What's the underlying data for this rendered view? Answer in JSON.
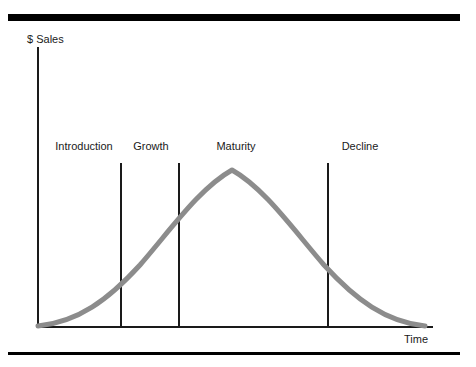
{
  "figure": {
    "background_color": "#ffffff",
    "width": 476,
    "height": 367
  },
  "rules": {
    "top_label": "top-rule",
    "bottom_label": "bottom-rule",
    "color": "#000000"
  },
  "axes": {
    "y_title": "$ Sales",
    "x_title": "Time",
    "color": "#1a1a1a"
  },
  "stages": [
    {
      "label": "Introduction",
      "center_x": 84,
      "divider_x": 120
    },
    {
      "label": "Growth",
      "center_x": 151,
      "divider_x": 178
    },
    {
      "label": "Maturity",
      "center_x": 236,
      "divider_x": 327
    },
    {
      "label": "Decline",
      "center_x": 360,
      "divider_x": null
    }
  ],
  "curve": {
    "color": "#8c8c8c",
    "stroke_width": 5,
    "path": "M 38 326 C 78 322, 108 300, 140 265 C 172 228, 200 188, 232 170 C 264 188, 292 228, 324 265 C 356 300, 386 322, 425 326"
  },
  "chart_data": {
    "type": "line",
    "title": "",
    "subtitle": "",
    "xlabel": "Time",
    "ylabel": "$ Sales",
    "grid": false,
    "legend": "none",
    "xlim": [
      0,
      100
    ],
    "ylim": [
      0,
      100
    ],
    "x_tick_labels": [],
    "y_tick_labels": [],
    "stage_boundaries": [
      21,
      36,
      74
    ],
    "annotations": [
      "Introduction",
      "Growth",
      "Maturity",
      "Decline"
    ],
    "series": [
      {
        "name": "Sales",
        "x": [
          0,
          5,
          10,
          15,
          20,
          25,
          30,
          35,
          40,
          45,
          50,
          55,
          60,
          65,
          70,
          75,
          80,
          85,
          90,
          95,
          100
        ],
        "values": [
          1,
          3,
          7,
          13,
          22,
          33,
          45,
          57,
          70,
          82,
          92,
          98,
          100,
          97,
          90,
          79,
          64,
          47,
          29,
          13,
          1
        ]
      }
    ]
  }
}
